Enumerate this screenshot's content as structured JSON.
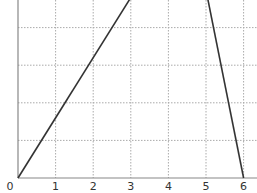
{
  "chart_data": {
    "type": "line",
    "title": "",
    "xlabel": "",
    "ylabel": "",
    "xlim": [
      0,
      6.3
    ],
    "ylim": [
      0,
      4.8
    ],
    "grid": true,
    "x_ticks": [
      "0",
      "1",
      "2",
      "3",
      "4",
      "5",
      "6"
    ],
    "y_ticks": [],
    "series": [
      {
        "name": "rising segment",
        "points": [
          [
            0,
            0
          ],
          [
            3,
            4.8
          ]
        ],
        "color": "#333333"
      },
      {
        "name": "falling segment",
        "points": [
          [
            5.04,
            4.8
          ],
          [
            6,
            0
          ]
        ],
        "color": "#333333"
      }
    ],
    "legend": null
  },
  "colors": {
    "axis": "#888888",
    "grid": "#aaaaaa",
    "line": "#333333",
    "label": "#333333"
  }
}
